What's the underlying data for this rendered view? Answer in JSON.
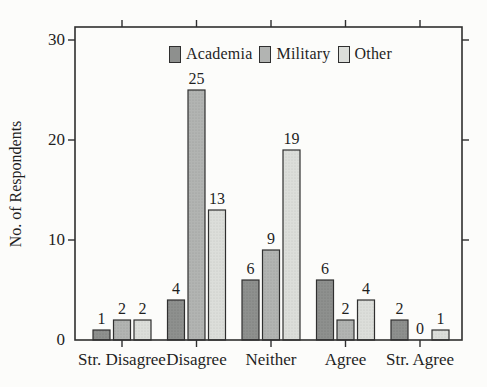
{
  "figure": {
    "background": "#fcfcfa",
    "ink": "#2f2f2f",
    "text_color": "#1f1f1f"
  },
  "chart_data": {
    "type": "bar",
    "title": "",
    "categories": [
      "Str. Disagree",
      "Disagree",
      "Neither",
      "Agree",
      "Str. Agree"
    ],
    "series": [
      {
        "name": "Academia",
        "color": "#8e908e",
        "dot_color": "#747674",
        "values": [
          1,
          4,
          6,
          6,
          2
        ]
      },
      {
        "name": "Military",
        "color": "#b2b4b2",
        "dot_color": "#989a98",
        "values": [
          2,
          25,
          9,
          2,
          0
        ]
      },
      {
        "name": "Other",
        "color": "#dcdeda",
        "dot_color": "#c2c4c1",
        "values": [
          2,
          13,
          19,
          4,
          1
        ]
      }
    ],
    "xlabel": "",
    "ylabel": "No. of Respondents",
    "yticks": [
      0,
      10,
      20,
      30
    ],
    "ylim": [
      0,
      31.3
    ],
    "grid": false,
    "legend_position": "top-center-inside",
    "value_labels": true
  }
}
